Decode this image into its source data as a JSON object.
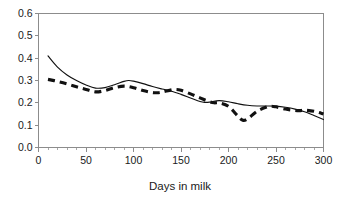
{
  "chart_data": {
    "type": "line",
    "title": "",
    "subtitle": "",
    "xlabel": "Days in milk",
    "ylabel": "",
    "xlim": [
      0,
      300
    ],
    "ylim": [
      0.0,
      0.6
    ],
    "grid": false,
    "legend": "none",
    "x_ticks": [
      0,
      50,
      100,
      150,
      200,
      250,
      300
    ],
    "x_tick_labels": [
      "0",
      "50",
      "100",
      "150",
      "200",
      "250",
      "300"
    ],
    "x_minor_tick_step": 10,
    "y_ticks": [
      0.0,
      0.1,
      0.2,
      0.3,
      0.4,
      0.5,
      0.6
    ],
    "y_tick_labels": [
      "0.0",
      "0.1",
      "0.2",
      "0.3",
      "0.4",
      "0.5",
      "0.6"
    ],
    "series": [
      {
        "name": "solid-curve",
        "style": "solid",
        "color": "#111111",
        "x": [
          10,
          20,
          30,
          40,
          50,
          60,
          70,
          80,
          90,
          95,
          100,
          110,
          120,
          130,
          140,
          150,
          160,
          170,
          175,
          180,
          190,
          200,
          210,
          220,
          230,
          240,
          250,
          260,
          270,
          280,
          290,
          300
        ],
        "y": [
          0.41,
          0.36,
          0.325,
          0.3,
          0.28,
          0.266,
          0.268,
          0.281,
          0.296,
          0.3,
          0.297,
          0.286,
          0.273,
          0.262,
          0.252,
          0.238,
          0.222,
          0.206,
          0.202,
          0.203,
          0.21,
          0.205,
          0.196,
          0.189,
          0.186,
          0.186,
          0.185,
          0.18,
          0.172,
          0.16,
          0.143,
          0.125
        ]
      },
      {
        "name": "dashed-curve",
        "style": "dashed",
        "color": "#111111",
        "x": [
          10,
          20,
          30,
          40,
          50,
          60,
          70,
          80,
          90,
          100,
          110,
          120,
          125,
          130,
          140,
          145,
          150,
          160,
          170,
          180,
          185,
          190,
          200,
          210,
          215,
          220,
          230,
          240,
          245,
          250,
          260,
          270,
          275,
          280,
          290,
          300
        ],
        "y": [
          0.305,
          0.296,
          0.285,
          0.272,
          0.26,
          0.249,
          0.255,
          0.268,
          0.275,
          0.268,
          0.255,
          0.246,
          0.245,
          0.248,
          0.258,
          0.26,
          0.256,
          0.24,
          0.222,
          0.205,
          0.2,
          0.2,
          0.184,
          0.14,
          0.122,
          0.128,
          0.162,
          0.181,
          0.185,
          0.182,
          0.172,
          0.166,
          0.165,
          0.167,
          0.162,
          0.15
        ]
      }
    ]
  },
  "axis": {
    "x_title": "Days in milk"
  }
}
